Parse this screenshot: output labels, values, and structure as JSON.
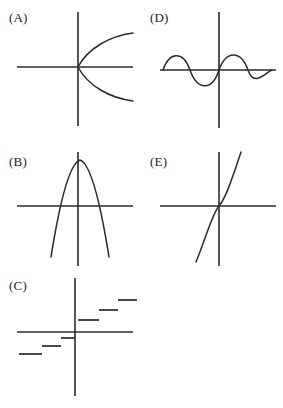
{
  "figure": {
    "background_color": "#ffffff",
    "ink_color": "#2b2b2b",
    "panel_count": 5,
    "layout": "2-column grid of coordinate-axis graphs"
  },
  "panels": [
    {
      "id": "A",
      "label": "(A)",
      "label_x": 9,
      "label_y": 11,
      "graph_type": "sideways-parabola",
      "description": "Rightward-opening parabola with vertex at the origin",
      "origin_x": 78,
      "origin_y": 67,
      "x_axis": {
        "x1": 17,
        "x2": 133,
        "y": 67
      },
      "y_axis": {
        "y1": 12,
        "y2": 126,
        "x": 78
      },
      "curve_path": "M 133 33 C 110 36, 88 48, 78 67 C 88 86, 110 98, 133 101"
    },
    {
      "id": "D",
      "label": "(D)",
      "label_x": 150,
      "label_y": 11,
      "graph_type": "sine-wave",
      "description": "Sine-like wave: crest on the left, trough centered at the origin, crest on the right",
      "origin_x": 219,
      "origin_y": 70,
      "x_axis": {
        "x1": 160,
        "x2": 276,
        "y": 70
      },
      "y_axis": {
        "y1": 12,
        "y2": 128,
        "x": 219
      },
      "curve_path": "M 163 70 C 169 52, 183 50, 190 70 C 197 90, 212 92, 219 70 C 226 50, 241 50, 248 70 C 254 88, 266 72, 272 70"
    },
    {
      "id": "B",
      "label": "(B)",
      "label_x": 9,
      "label_y": 155,
      "graph_type": "downward-parabola",
      "description": "Downward-opening parabola with vertex above the x-axis",
      "origin_x": 78,
      "origin_y": 206,
      "x_axis": {
        "x1": 17,
        "x2": 133,
        "y": 206
      },
      "y_axis": {
        "y1": 152,
        "y2": 266,
        "x": 78
      },
      "curve_path": "M 51 257 C 58 213, 68 164, 80 160 C 92 164, 102 213, 109 257"
    },
    {
      "id": "E",
      "label": "(E)",
      "label_x": 150,
      "label_y": 155,
      "graph_type": "cubic",
      "description": "Cubic curve through the origin with a flat inflection point",
      "origin_x": 219,
      "origin_y": 206,
      "x_axis": {
        "x1": 160,
        "x2": 276,
        "y": 206
      },
      "y_axis": {
        "y1": 152,
        "y2": 266,
        "x": 219
      },
      "curve_path": "M 196 262 C 206 238, 212 214, 219 206 C 226 198, 233 176, 241 152"
    },
    {
      "id": "C",
      "label": "(C)",
      "label_x": 9,
      "label_y": 279,
      "graph_type": "step-function",
      "description": "Step function of six horizontal segments increasing from lower-left to upper-right",
      "origin_x": 75,
      "origin_y": 332,
      "x_axis": {
        "x1": 17,
        "x2": 133,
        "y": 332
      },
      "y_axis": {
        "y1": 278,
        "y2": 396,
        "x": 75
      },
      "steps": [
        {
          "x1": 19,
          "x2": 42,
          "y": 354
        },
        {
          "x1": 42,
          "x2": 61,
          "y": 346
        },
        {
          "x1": 61,
          "x2": 75,
          "y": 338
        },
        {
          "x1": 78,
          "x2": 99,
          "y": 320
        },
        {
          "x1": 99,
          "x2": 118,
          "y": 310
        },
        {
          "x1": 118,
          "x2": 137,
          "y": 300
        }
      ]
    }
  ]
}
